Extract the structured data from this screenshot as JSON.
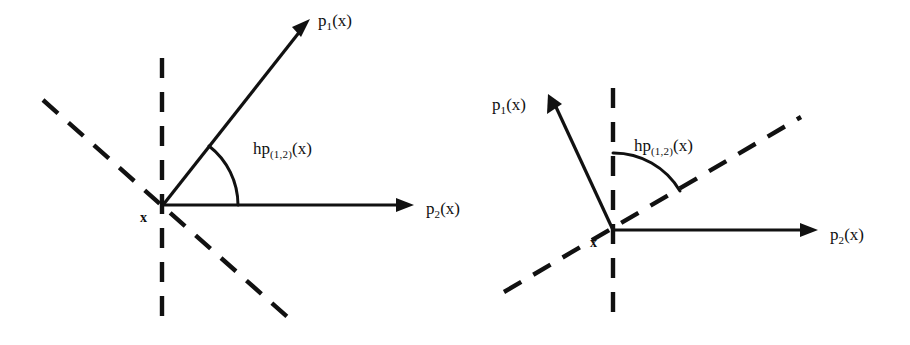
{
  "figure": {
    "type": "geometric-diagram",
    "background_color": "#ffffff",
    "ink_color": "#111111",
    "panel_count": 2
  },
  "panels": [
    {
      "id": "left",
      "name": "left-diagram",
      "origin_label": "x",
      "rays": [
        {
          "name": "p1-ray",
          "label_base": "p",
          "label_sub": "1",
          "label_tail": "(x)",
          "label_full": "p1(x)",
          "direction": "up-right",
          "angle_deg": 52
        },
        {
          "name": "p2-ray",
          "label_base": "p",
          "label_sub": "2",
          "label_tail": "(x)",
          "label_full": "p2(x)",
          "direction": "right",
          "angle_deg": 0
        }
      ],
      "angle_arc": {
        "name": "angle-arc",
        "label_base": "hp",
        "label_sub": "(1,2)",
        "label_tail": "(x)",
        "label_full": "hp(1,2)(x)",
        "from_ray": "p1-ray",
        "to_ray": "p2-ray",
        "measure_deg": 52
      },
      "dashed_lines": [
        {
          "name": "vertical-dashed-line",
          "orientation": "vertical"
        },
        {
          "name": "diagonal-dashed-line",
          "orientation": "descending-diagonal",
          "angle_deg": -41
        }
      ]
    },
    {
      "id": "right",
      "name": "right-diagram",
      "origin_label": "x",
      "rays": [
        {
          "name": "p1-ray",
          "label_base": "p",
          "label_sub": "1",
          "label_tail": "(x)",
          "label_full": "p1(x)",
          "direction": "up-left",
          "angle_deg": 116
        },
        {
          "name": "p2-ray",
          "label_base": "p",
          "label_sub": "2",
          "label_tail": "(x)",
          "label_full": "p2(x)",
          "direction": "right",
          "angle_deg": 0
        }
      ],
      "angle_arc": {
        "name": "angle-arc",
        "label_base": "hp",
        "label_sub": "(1,2)",
        "label_tail": "(x)",
        "label_full": "hp(1,2)(x)",
        "from_ray": "vertical-dashed-line",
        "to_ray": "diagonal-dashed-line",
        "measure_deg": 60
      },
      "dashed_lines": [
        {
          "name": "vertical-dashed-line",
          "orientation": "vertical"
        },
        {
          "name": "diagonal-dashed-line",
          "orientation": "ascending-diagonal",
          "angle_deg": 30
        }
      ]
    }
  ]
}
